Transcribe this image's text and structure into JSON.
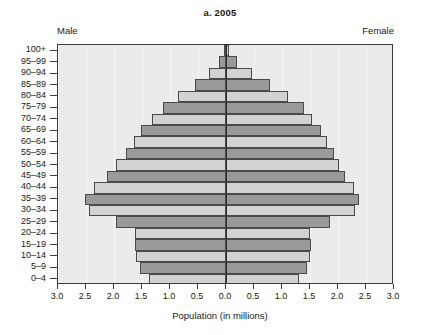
{
  "figure": {
    "title": "a. 2005",
    "left_label": "Male",
    "right_label": "Female",
    "xaxis_title": "Population (in millions)"
  },
  "axes": {
    "x_ticks": [
      "3.0",
      "2.5",
      "2.0",
      "1.5",
      "1.0",
      "0.5",
      "0.0",
      "0.5",
      "1.0",
      "1.5",
      "2.0",
      "2.5",
      "3.0"
    ],
    "x_tick_values": [
      -3.0,
      -2.5,
      -2.0,
      -1.5,
      -1.0,
      -0.5,
      0.0,
      0.5,
      1.0,
      1.5,
      2.0,
      2.5,
      3.0
    ],
    "xlim": [
      -3.0,
      3.0
    ],
    "y_ticks": [
      "100+",
      "95–99",
      "90–94",
      "85–89",
      "80–84",
      "75–79",
      "70–74",
      "65–69",
      "60–64",
      "55–59",
      "50–54",
      "45–49",
      "40–44",
      "35–39",
      "30–34",
      "25–29",
      "20–24",
      "15–19",
      "10–14",
      "5–9",
      "0–4"
    ]
  },
  "colors": {
    "plot_background": "#ebebeb",
    "bar_light": "#d2d2d2",
    "bar_dark": "#9a9a9a",
    "bar_edge": "#4a4a4a",
    "frame": "#3c3c3c",
    "zero_axis": "#2b2b2b",
    "gridline": "#f7f7f7"
  },
  "chart_data": {
    "type": "bar",
    "title": "a. 2005",
    "xlabel": "Population (in millions)",
    "ylabel": "",
    "xlim": [
      -3.0,
      3.0
    ],
    "grid": true,
    "legend": "none",
    "orientation": "horizontal",
    "subtype": "population-pyramid",
    "categories": [
      "0–4",
      "5–9",
      "10–14",
      "15–19",
      "20–24",
      "25–29",
      "30–34",
      "35–39",
      "40–44",
      "45–49",
      "50–54",
      "55–59",
      "60–64",
      "65–69",
      "70–74",
      "75–79",
      "80–84",
      "85–89",
      "90–94",
      "95–99",
      "100+"
    ],
    "series": [
      {
        "name": "Male",
        "direction": "left",
        "values": [
          1.38,
          1.53,
          1.6,
          1.62,
          1.62,
          1.96,
          2.44,
          2.52,
          2.35,
          2.12,
          1.96,
          1.78,
          1.64,
          1.52,
          1.32,
          1.12,
          0.86,
          0.56,
          0.3,
          0.12,
          0.03
        ]
      },
      {
        "name": "Female",
        "direction": "right",
        "values": [
          1.3,
          1.44,
          1.5,
          1.52,
          1.5,
          1.86,
          2.3,
          2.38,
          2.28,
          2.12,
          2.02,
          1.92,
          1.8,
          1.7,
          1.54,
          1.4,
          1.1,
          0.78,
          0.46,
          0.2,
          0.06
        ]
      }
    ]
  },
  "bar_shading": [
    "light",
    "dark",
    "light",
    "dark",
    "light",
    "dark",
    "light",
    "dark",
    "light",
    "dark",
    "light",
    "dark",
    "light",
    "dark",
    "light",
    "dark",
    "light",
    "dark",
    "light",
    "dark",
    "light"
  ]
}
